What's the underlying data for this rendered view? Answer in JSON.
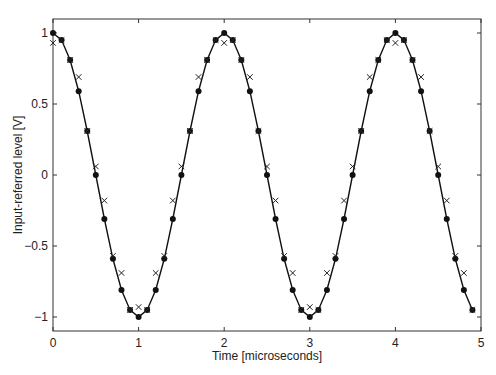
{
  "chart_data": {
    "type": "line",
    "title": "",
    "xlabel": "Time [microseconds]",
    "ylabel": "Input-referred level [V]",
    "xlim": [
      0,
      5
    ],
    "ylim": [
      -1.1,
      1.1
    ],
    "xticks": [
      0,
      1,
      2,
      3,
      4,
      5
    ],
    "xtick_labels": [
      "0",
      "1",
      "2",
      "3",
      "4",
      "5"
    ],
    "yticks": [
      -1,
      -0.5,
      0,
      0.5,
      1
    ],
    "ytick_labels": [
      "−1",
      "−0.5",
      "0",
      "0.5",
      "1"
    ],
    "grid": false,
    "legend": null,
    "x": [
      0.0,
      0.1,
      0.2,
      0.3,
      0.4,
      0.5,
      0.6,
      0.7,
      0.8,
      0.9,
      1.0,
      1.1,
      1.2,
      1.3,
      1.4,
      1.5,
      1.6,
      1.7,
      1.8,
      1.9,
      2.0,
      2.1,
      2.2,
      2.3,
      2.4,
      2.5,
      2.6,
      2.7,
      2.8,
      2.9,
      3.0,
      3.1,
      3.2,
      3.3,
      3.4,
      3.5,
      3.6,
      3.7,
      3.8,
      3.9,
      4.0,
      4.1,
      4.2,
      4.3,
      4.4,
      4.5,
      4.6,
      4.7,
      4.8,
      4.9
    ],
    "series": [
      {
        "name": "Input signal (solid line, dot markers)",
        "style": "line-dot",
        "values": [
          1.0,
          0.95,
          0.81,
          0.59,
          0.31,
          0.0,
          -0.31,
          -0.59,
          -0.81,
          -0.95,
          -1.0,
          -0.95,
          -0.81,
          -0.59,
          -0.31,
          0.0,
          0.31,
          0.59,
          0.81,
          0.95,
          1.0,
          0.95,
          0.81,
          0.59,
          0.31,
          0.0,
          -0.31,
          -0.59,
          -0.81,
          -0.95,
          -1.0,
          -0.95,
          -0.81,
          -0.59,
          -0.31,
          0.0,
          0.31,
          0.59,
          0.81,
          0.95,
          1.0,
          0.95,
          0.81,
          0.59,
          0.31,
          0.0,
          -0.31,
          -0.59,
          -0.81,
          -0.95
        ]
      },
      {
        "name": "Measured samples (x markers)",
        "style": "x-marker",
        "values": [
          0.93,
          0.95,
          0.81,
          0.69,
          0.31,
          0.06,
          -0.18,
          -0.57,
          -0.69,
          -0.95,
          -0.93,
          -0.95,
          -0.69,
          -0.57,
          -0.18,
          0.06,
          0.31,
          0.69,
          0.81,
          0.95,
          0.93,
          0.95,
          0.81,
          0.69,
          0.31,
          0.06,
          -0.18,
          -0.57,
          -0.69,
          -0.95,
          -0.93,
          -0.95,
          -0.69,
          -0.57,
          -0.18,
          0.06,
          0.31,
          0.69,
          0.81,
          0.95,
          0.93,
          0.95,
          0.81,
          0.69,
          0.31,
          0.06,
          -0.18,
          -0.57,
          -0.69,
          -0.95
        ]
      }
    ]
  },
  "colors": {
    "line": "#111111",
    "axes": "#333333",
    "background": "#ffffff"
  }
}
